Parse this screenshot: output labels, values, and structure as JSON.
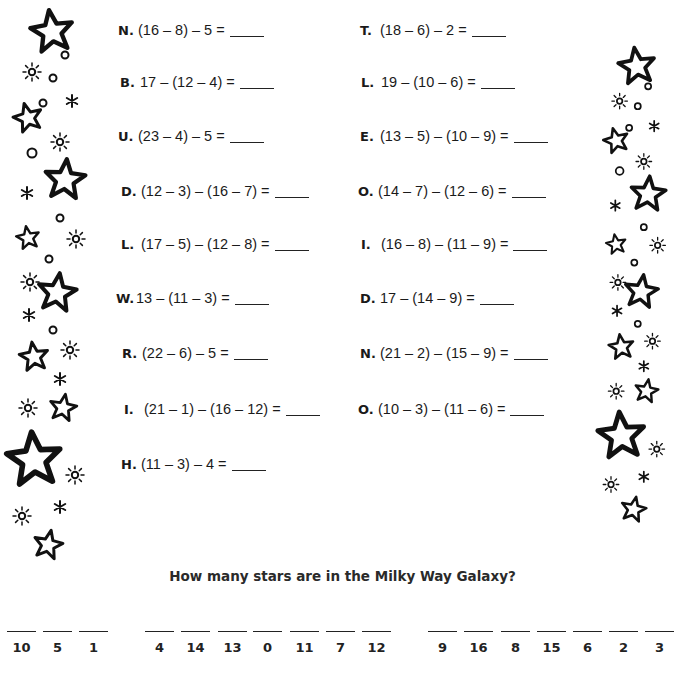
{
  "problems_left": [
    {
      "letter": "N.",
      "expression": "(16 – 8) – 5 ="
    },
    {
      "letter": "B.",
      "expression": "17 – (12 – 4) ="
    },
    {
      "letter": "U.",
      "expression": "(23 – 4) – 5 ="
    },
    {
      "letter": "D.",
      "expression": "(12 – 3) – (16 – 7) ="
    },
    {
      "letter": "L.",
      "expression": "(17 – 5) – (12 – 8) ="
    },
    {
      "letter": "W.",
      "expression": "13 – (11 – 3) ="
    },
    {
      "letter": "R.",
      "expression": "(22 – 6) – 5 ="
    },
    {
      "letter": "I.",
      "expression": "(21 – 1) – (16 – 12) ="
    },
    {
      "letter": "H.",
      "expression": "(11 – 3) – 4 ="
    }
  ],
  "problems_right": [
    {
      "letter": "T.",
      "expression": "(18 – 6) – 2 ="
    },
    {
      "letter": "L.",
      "expression": "19 – (10 – 6) ="
    },
    {
      "letter": "E.",
      "expression": "(13 – 5) – (10 – 9) ="
    },
    {
      "letter": "O.",
      "expression": "(14 – 7) – (12 – 6) ="
    },
    {
      "letter": "I.",
      "expression": "(16 – 8) – (11 – 9) ="
    },
    {
      "letter": "D.",
      "expression": "17 – (14 – 9) ="
    },
    {
      "letter": "N.",
      "expression": "(21 – 2) – (15 – 9) ="
    },
    {
      "letter": "O.",
      "expression": "(10 – 3) – (11 – 6) ="
    }
  ],
  "question": "How many stars are in the Milky Way Galaxy?",
  "answer_groups": [
    [
      "10",
      "5",
      "1"
    ],
    [
      "4",
      "14",
      "13",
      "0",
      "11",
      "7",
      "12"
    ],
    [
      "9",
      "16",
      "8",
      "15",
      "6",
      "2",
      "3"
    ]
  ],
  "decorations": {
    "left_border": "star-border-icon",
    "right_border": "star-border-icon"
  }
}
